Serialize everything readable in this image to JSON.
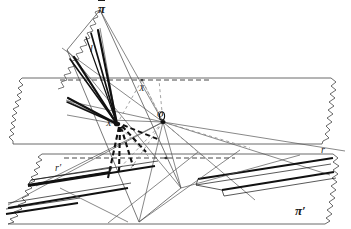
{
  "figure": {
    "background_color": "#ffffff",
    "ink_color": "#1b1b1b",
    "thin_color": "#555555",
    "width": 351,
    "height": 229
  },
  "labels": {
    "plane_pi_bar": "π",
    "plane_pi_prime": "π′",
    "point_o": "O",
    "point_x_left": "X",
    "point_x_upper": "X",
    "line_l": "l",
    "line_r_left": "r′",
    "line_r_right": "r"
  },
  "label_positions": {
    "plane_pi_bar": {
      "x": 98,
      "y": 4
    },
    "plane_pi_prime": {
      "x": 297,
      "y": 206
    },
    "point_o": {
      "x": 157,
      "y": 112
    },
    "point_x_left": {
      "x": 107,
      "y": 120
    },
    "point_x_upper": {
      "x": 140,
      "y": 85
    },
    "line_l": {
      "x": 90,
      "y": 45
    },
    "line_r_left": {
      "x": 56,
      "y": 164
    },
    "line_r_right": {
      "x": 322,
      "y": 146
    }
  },
  "geometry": {
    "upper_plane": {
      "name": "horizontal-plane-upper",
      "top_edge_y": 78,
      "bottom_edge_y": 144,
      "left_x": 8,
      "right_x": 344,
      "ragged_left": true,
      "ragged_right": true
    },
    "lower_plane": {
      "name": "horizontal-plane-lower",
      "top_edge_y": 154,
      "bottom_edge_y": 224,
      "left_x": 4,
      "right_x": 344,
      "ragged_left": true,
      "ragged_right": true
    },
    "tilted_plane": {
      "name": "tilted-plane-pi-bar",
      "apex_top": {
        "x": 103,
        "y": 8
      },
      "apex_bottom": {
        "x": 139,
        "y": 222
      },
      "left_corner": {
        "x": 67,
        "y": 48
      },
      "right_corner": {
        "x": 181,
        "y": 188
      }
    },
    "point_o": {
      "x": 163,
      "y": 122
    },
    "point_x": {
      "x": 117,
      "y": 124
    }
  }
}
